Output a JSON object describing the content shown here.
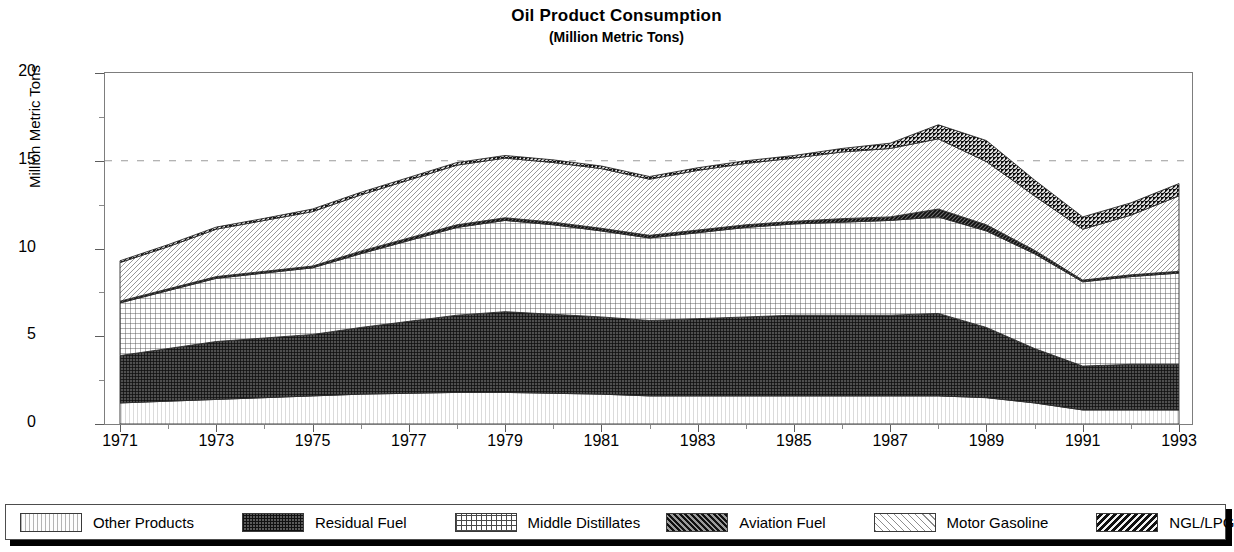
{
  "chart_data": {
    "type": "area",
    "title": "Oil Product Consumption",
    "subtitle": "(Million Metric Tons)",
    "xlabel": "",
    "ylabel": "Million Metric Tons",
    "stacked": true,
    "grid": "dashed horizontal gridline at y=15",
    "legend_position": "bottom",
    "xlim": [
      1971,
      1993
    ],
    "ylim": [
      0,
      20
    ],
    "ytick_labels": [
      "0",
      "5",
      "10",
      "15",
      "20"
    ],
    "ytick_values": [
      0,
      5,
      10,
      15,
      20
    ],
    "ytick_minor_values": [
      2.5,
      7.5,
      12.5,
      17.5
    ],
    "x": [
      1971,
      1972,
      1973,
      1974,
      1975,
      1976,
      1977,
      1978,
      1979,
      1980,
      1981,
      1982,
      1983,
      1984,
      1985,
      1986,
      1987,
      1988,
      1989,
      1990,
      1991,
      1992,
      1993
    ],
    "xtick_labels": [
      "1971",
      "1973",
      "1975",
      "1977",
      "1979",
      "1981",
      "1983",
      "1985",
      "1987",
      "1989",
      "1991",
      "1993"
    ],
    "xtick_values": [
      1971,
      1973,
      1975,
      1977,
      1979,
      1981,
      1983,
      1985,
      1987,
      1989,
      1991,
      1993
    ],
    "series": [
      {
        "name": "Other Products",
        "pattern": "vertical-lines-light",
        "color": "#fdfdfd",
        "values": [
          1.2,
          1.3,
          1.4,
          1.5,
          1.6,
          1.7,
          1.75,
          1.8,
          1.8,
          1.75,
          1.7,
          1.6,
          1.6,
          1.6,
          1.6,
          1.6,
          1.6,
          1.6,
          1.5,
          1.2,
          0.8,
          0.8,
          0.8
        ]
      },
      {
        "name": "Residual Fuel",
        "pattern": "dense-checker-dark",
        "color": "#5a5a5a",
        "values": [
          2.7,
          3.0,
          3.3,
          3.4,
          3.5,
          3.8,
          4.1,
          4.4,
          4.6,
          4.5,
          4.4,
          4.3,
          4.4,
          4.5,
          4.6,
          4.6,
          4.6,
          4.7,
          4.0,
          3.1,
          2.5,
          2.6,
          2.6
        ]
      },
      {
        "name": "Middle Distillates",
        "pattern": "grid-medium",
        "color": "#ffffff",
        "values": [
          3.0,
          3.3,
          3.6,
          3.7,
          3.8,
          4.2,
          4.6,
          5.0,
          5.2,
          5.1,
          4.9,
          4.7,
          4.9,
          5.1,
          5.2,
          5.3,
          5.4,
          5.5,
          5.5,
          5.4,
          4.8,
          5.0,
          5.2
        ]
      },
      {
        "name": "Aviation Fuel",
        "pattern": "diagonal-dark",
        "color": "#6b6b6b",
        "values": [
          0.1,
          0.1,
          0.1,
          0.1,
          0.1,
          0.15,
          0.15,
          0.15,
          0.15,
          0.15,
          0.15,
          0.15,
          0.15,
          0.15,
          0.15,
          0.2,
          0.2,
          0.45,
          0.35,
          0.2,
          0.1,
          0.1,
          0.1
        ]
      },
      {
        "name": "Motor Gasoline",
        "pattern": "diagonal-light",
        "color": "#ffffff",
        "values": [
          2.2,
          2.4,
          2.7,
          2.9,
          3.1,
          3.2,
          3.3,
          3.4,
          3.4,
          3.4,
          3.4,
          3.2,
          3.4,
          3.5,
          3.6,
          3.8,
          3.9,
          4.0,
          3.6,
          3.1,
          2.9,
          3.4,
          4.3
        ]
      },
      {
        "name": "NGL/LPG",
        "pattern": "diagonal-dense-dark",
        "color": "#1c1c1c",
        "values": [
          0.1,
          0.12,
          0.12,
          0.12,
          0.15,
          0.15,
          0.15,
          0.15,
          0.15,
          0.15,
          0.15,
          0.15,
          0.15,
          0.15,
          0.15,
          0.2,
          0.3,
          0.8,
          1.2,
          0.9,
          0.7,
          0.7,
          0.7
        ]
      }
    ],
    "series_totals": [
      9.3,
      10.2,
      11.2,
      11.7,
      12.25,
      13.2,
      14.05,
      14.9,
      17.0,
      16.95,
      15.7,
      14.7,
      15.3,
      15.8,
      16.1,
      16.5,
      16.8,
      17.15,
      16.15,
      13.65,
      11.8,
      12.6,
      13.7
    ]
  },
  "legend": {
    "items": [
      {
        "label": "Other Products",
        "swatch": "other-products-swatch"
      },
      {
        "label": "Residual Fuel",
        "swatch": "residual-fuel-swatch"
      },
      {
        "label": "Middle Distillates",
        "swatch": "middle-distillates-swatch"
      },
      {
        "label": "Aviation Fuel",
        "swatch": "aviation-fuel-swatch"
      },
      {
        "label": "Motor Gasoline",
        "swatch": "motor-gasoline-swatch"
      },
      {
        "label": "NGL/LPG",
        "swatch": "ngl-lpg-swatch"
      }
    ]
  }
}
